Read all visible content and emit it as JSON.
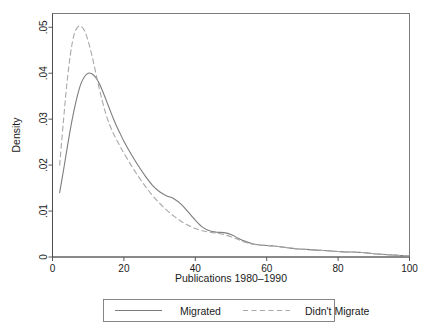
{
  "figure": {
    "background_color": "#ffffff",
    "frame_color": "#6f6f6f",
    "text_color": "#1b1b1b"
  },
  "chart_data": {
    "type": "line",
    "title": "",
    "xlabel": "Publications 1980–1990",
    "ylabel": "Density",
    "xlim": [
      0,
      100
    ],
    "ylim": [
      0,
      0.053
    ],
    "grid": false,
    "legend_position": "bottom-outside",
    "xticks": [
      0,
      20,
      40,
      60,
      80,
      100
    ],
    "xtick_labels": [
      "0",
      "20",
      "40",
      "60",
      "80",
      "100"
    ],
    "yticks": [
      0,
      0.01,
      0.02,
      0.03,
      0.04,
      0.05
    ],
    "ytick_labels": [
      "0",
      ".01",
      ".02",
      ".03",
      ".04",
      ".05"
    ],
    "series": [
      {
        "name": "Migrated",
        "style": "solid",
        "color": "#7d7d7d",
        "width": 1.1,
        "x": [
          2,
          3,
          4,
          5,
          6,
          7,
          8,
          9,
          10,
          11,
          12,
          13,
          14,
          15,
          16,
          17,
          18,
          19,
          20,
          22,
          24,
          26,
          28,
          30,
          32,
          34,
          36,
          38,
          40,
          42,
          44,
          46,
          48,
          50,
          52,
          54,
          56,
          58,
          60,
          62,
          64,
          66,
          68,
          70,
          72,
          74,
          76,
          78,
          80,
          82,
          84,
          86,
          88,
          90,
          92,
          94,
          96,
          98,
          100
        ],
        "y": [
          0.014,
          0.0185,
          0.0232,
          0.0278,
          0.0318,
          0.0352,
          0.0378,
          0.0393,
          0.04,
          0.0399,
          0.0392,
          0.0379,
          0.0362,
          0.0342,
          0.0322,
          0.0302,
          0.0284,
          0.0268,
          0.0252,
          0.0224,
          0.0199,
          0.0176,
          0.0156,
          0.0142,
          0.0133,
          0.0127,
          0.0115,
          0.0098,
          0.008,
          0.0065,
          0.0057,
          0.0054,
          0.0053,
          0.0049,
          0.0041,
          0.0034,
          0.0029,
          0.0026,
          0.0025,
          0.0024,
          0.0022,
          0.002,
          0.0018,
          0.0017,
          0.0016,
          0.0015,
          0.0014,
          0.0013,
          0.0012,
          0.0011,
          0.0011,
          0.001,
          0.0009,
          0.0007,
          0.0006,
          0.0005,
          0.0004,
          0.0003,
          0.0003
        ]
      },
      {
        "name": "Didn't Migrate",
        "style": "dashed",
        "color": "#a8a8a8",
        "width": 1.1,
        "x": [
          2,
          3,
          4,
          5,
          6,
          7,
          8,
          9,
          10,
          11,
          12,
          13,
          14,
          15,
          16,
          17,
          18,
          19,
          20,
          22,
          24,
          26,
          28,
          30,
          32,
          34,
          36,
          38,
          40,
          42,
          44,
          46,
          48,
          50,
          52,
          54,
          56,
          58,
          60,
          62,
          64,
          66,
          68,
          70,
          72,
          74,
          76,
          78,
          80,
          82,
          84,
          86,
          88,
          90,
          92,
          94,
          96,
          98,
          100
        ],
        "y": [
          0.02,
          0.029,
          0.0375,
          0.044,
          0.0483,
          0.05,
          0.0502,
          0.0492,
          0.047,
          0.044,
          0.0405,
          0.037,
          0.0338,
          0.031,
          0.0288,
          0.027,
          0.0254,
          0.024,
          0.0226,
          0.02,
          0.0176,
          0.0154,
          0.0134,
          0.0117,
          0.0102,
          0.0089,
          0.0078,
          0.0069,
          0.0062,
          0.0057,
          0.0054,
          0.0052,
          0.0049,
          0.0044,
          0.0038,
          0.0032,
          0.0028,
          0.0026,
          0.0025,
          0.0024,
          0.0022,
          0.002,
          0.0018,
          0.0017,
          0.0016,
          0.0015,
          0.0014,
          0.0013,
          0.0012,
          0.0011,
          0.0011,
          0.001,
          0.0009,
          0.0007,
          0.0006,
          0.0005,
          0.0004,
          0.0003,
          0.0003
        ]
      }
    ]
  },
  "legend": {
    "entries": [
      {
        "label": "Migrated",
        "style": "solid",
        "color": "#7d7d7d"
      },
      {
        "label": "Didn't Migrate",
        "style": "dashed",
        "color": "#a8a8a8"
      }
    ]
  }
}
